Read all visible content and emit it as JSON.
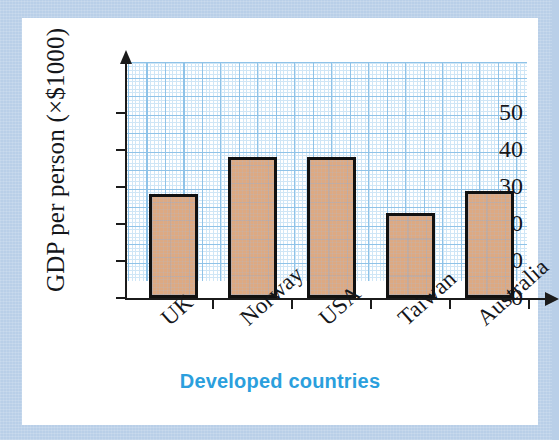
{
  "figure": {
    "frame_color": "#b9cfe8",
    "card_color": "#ffffff",
    "bar_fill": "#dda982",
    "bar_stroke": "#111111",
    "grid_major_color": "#8fc3e8",
    "grid_minor_color": "#cfe6f6",
    "axis_color": "#1b1b1b",
    "xtitle_color": "#2b9fdd"
  },
  "chart_data": {
    "type": "bar",
    "title": "",
    "xlabel": "Developed countries",
    "ylabel": "GDP per person (×$1000)",
    "categories": [
      "UK",
      "Norway",
      "USA",
      "Taiwan",
      "Australia"
    ],
    "values": [
      28,
      38,
      38,
      23,
      29
    ],
    "ylim": [
      0,
      55
    ],
    "ytick_labels": [
      "0",
      "10",
      "20",
      "30",
      "40",
      "50"
    ],
    "ytick_values": [
      0,
      10,
      20,
      30,
      40,
      50
    ],
    "grid": "graph-paper",
    "legend": "none",
    "units": "×$1000"
  }
}
